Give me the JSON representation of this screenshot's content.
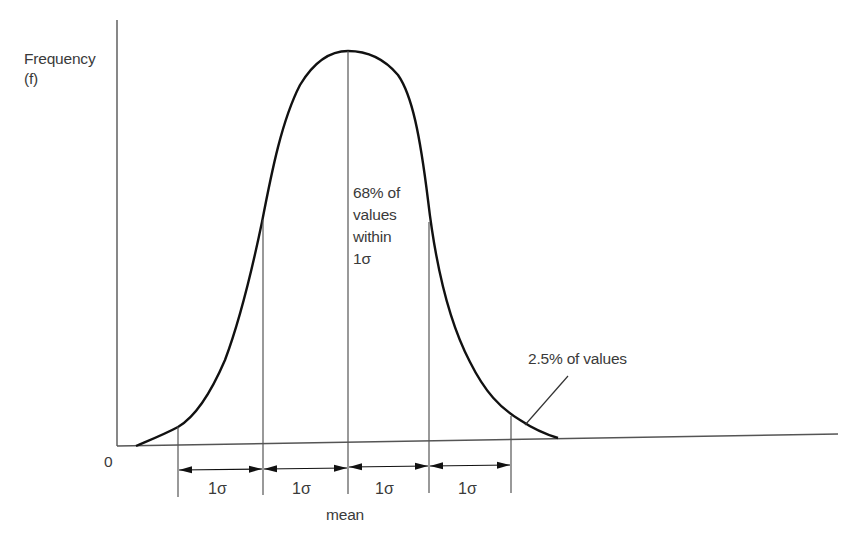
{
  "diagram": {
    "y_axis": {
      "label_line1": "Frequency",
      "label_line2": "(f)"
    },
    "origin_label": "0",
    "center_annotation": {
      "line1": "68% of",
      "line2": "values",
      "line3": "within",
      "line4": "1σ"
    },
    "tail_annotation": "2.5% of values",
    "mean_label": "mean",
    "intervals": [
      {
        "label": "1σ"
      },
      {
        "label": "1σ"
      },
      {
        "label": "1σ"
      },
      {
        "label": "1σ"
      }
    ],
    "colors": {
      "curve": "#111111",
      "lines": "#555555",
      "text": "#3a3a3a",
      "background": "#ffffff"
    }
  }
}
